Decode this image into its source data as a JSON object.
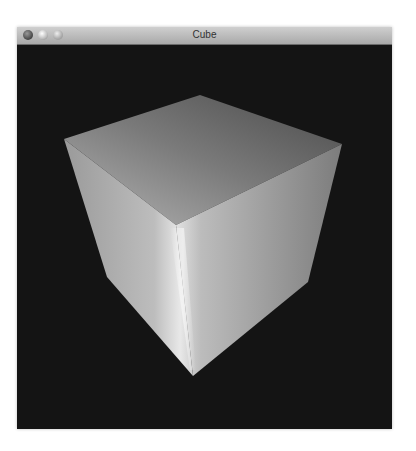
{
  "window": {
    "title": "Cube",
    "buttons": {
      "close": "close",
      "minimize": "minimize",
      "zoom": "zoom"
    }
  },
  "scene": {
    "object": "cube",
    "background_color": "#141414",
    "faces": [
      "top",
      "left-front",
      "right-front"
    ]
  }
}
